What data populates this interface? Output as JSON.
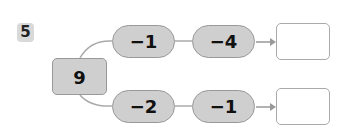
{
  "problem": {
    "number": "5",
    "start_value": "9",
    "rows": [
      {
        "ops": [
          "−1",
          "−4"
        ],
        "answer": ""
      },
      {
        "ops": [
          "−2",
          "−1"
        ],
        "answer": ""
      }
    ]
  },
  "colors": {
    "pill_fill": "#cfcfcf",
    "border": "#999999",
    "badge_fill": "#d9d9d9"
  }
}
